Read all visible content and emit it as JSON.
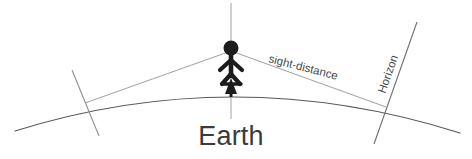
{
  "diagram": {
    "title_label": "Earth",
    "sight_label": "sight-distance",
    "horizon_label": "Horizon",
    "background_color": "#ffffff",
    "arc_color": "#555555",
    "line_color": "#8a8a8a",
    "figure_color": "#1c1c1c",
    "text_color": "#3b3b3b",
    "elements": {
      "earth_arc_name": "earth-surface-arc",
      "observer_name": "observer-stick-figure",
      "vertical_axis_name": "vertical-radius-line",
      "height_arrow_name": "observer-height-arrow",
      "sight_left_name": "sight-line-left",
      "sight_right_name": "sight-line-right",
      "horizon_left_name": "horizon-tangent-left",
      "horizon_right_name": "horizon-tangent-right"
    }
  }
}
